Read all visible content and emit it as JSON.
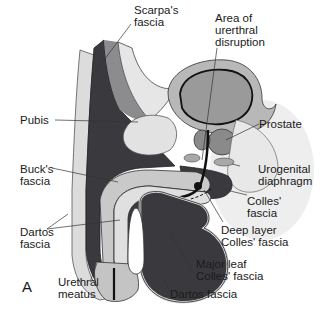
{
  "figure": {
    "panel_letter": "A",
    "colors": {
      "background": "#ffffff",
      "dark_tissue": "#3a3a3e",
      "mid_gray": "#8c8c8e",
      "light_gray": "#c9c9c9",
      "pale": "#dedede",
      "bladder_fill": "#9a9a9a",
      "outline": "#1a1a1a"
    },
    "labels": [
      {
        "id": "scarpas-fascia",
        "text": "Scarpa's\nfascia"
      },
      {
        "id": "area-urethral-disruption",
        "text": "Area of\nurerthral\ndisruption"
      },
      {
        "id": "pubis",
        "text": "Pubis"
      },
      {
        "id": "prostate",
        "text": "Prostate"
      },
      {
        "id": "bucks-fascia",
        "text": "Buck's\nfascia"
      },
      {
        "id": "urogenital-diaphragm",
        "text": "Urogenital\ndiaphragm"
      },
      {
        "id": "colles-fascia",
        "text": "Colles'\nfascia"
      },
      {
        "id": "dartos-fascia-left",
        "text": "Dartos\nfascia"
      },
      {
        "id": "deep-layer-colles-fascia",
        "text": "Deep layer\nColles' fascia"
      },
      {
        "id": "major-leaf-colles-fascia",
        "text": "Major leaf\nColles' fascia"
      },
      {
        "id": "urethral-meatus",
        "text": "Urethral\nmeatus"
      },
      {
        "id": "dartos-fascia-bottom",
        "text": "Dartos fascia"
      }
    ]
  }
}
